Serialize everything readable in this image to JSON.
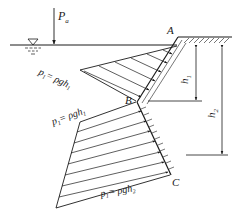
{
  "diagram": {
    "type": "hydrostatic-pressure-on-broken-wall",
    "labels": {
      "atmospheric_pressure": "P",
      "atmospheric_pressure_sub": "a",
      "point_a": "A",
      "point_b": "B",
      "point_c": "C",
      "h1": "h",
      "h1_sub": "1",
      "h2": "h",
      "h2_sub": "2",
      "p1_upper": "p",
      "p1_upper_sub": "1",
      "p1_upper_eq": "= ρgh",
      "p1_upper_eq_sub": "1",
      "p1_lower": "p",
      "p1_lower_sub": "1",
      "p1_lower_eq": "= ρgh",
      "p1_lower_eq_sub": "1",
      "p2": "p",
      "p2_sub": "1",
      "p2_eq": "= ρgh",
      "p2_eq_sub": "2"
    },
    "colors": {
      "line": "#1a1a1a",
      "background": "#ffffff"
    }
  }
}
